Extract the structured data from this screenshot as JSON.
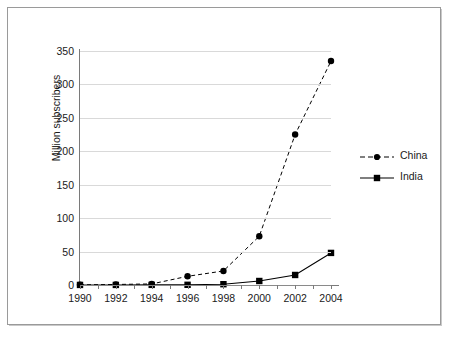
{
  "chart_data": {
    "type": "line",
    "title": "",
    "xlabel": "",
    "ylabel": "Million subscribers",
    "x": [
      1990,
      1992,
      1994,
      1996,
      1998,
      2000,
      2002,
      2004
    ],
    "xtick_labels": [
      "1990",
      "1992",
      "1994",
      "1996",
      "1998",
      "2000",
      "2002",
      "2004"
    ],
    "ytick_labels": [
      "0",
      "50",
      "100",
      "150",
      "200",
      "250",
      "300",
      "350"
    ],
    "ytick_values": [
      0,
      50,
      100,
      150,
      200,
      250,
      300,
      350
    ],
    "xlim": [
      1990,
      2004
    ],
    "ylim": [
      0,
      350
    ],
    "grid": "horizontal",
    "legend_position": "right",
    "series": [
      {
        "name": "China",
        "values": [
          0.3,
          0.8,
          1.6,
          13,
          21,
          73,
          225,
          335
        ],
        "line_style": "dashed",
        "marker": "circle",
        "color": "#000000"
      },
      {
        "name": "India",
        "values": [
          0.1,
          0.1,
          0.2,
          0.3,
          1.2,
          6,
          15,
          48
        ],
        "line_style": "solid",
        "marker": "square",
        "color": "#000000"
      }
    ]
  },
  "legend": {
    "entries": [
      {
        "label": "China"
      },
      {
        "label": "India"
      }
    ]
  },
  "axes": {
    "y_title": "Million subscribers"
  },
  "colors": {
    "series": "#000000",
    "gridline": "#d9d9d9",
    "axis": "#7a7a7a",
    "frame": "#9a9a9a",
    "background": "#ffffff"
  }
}
